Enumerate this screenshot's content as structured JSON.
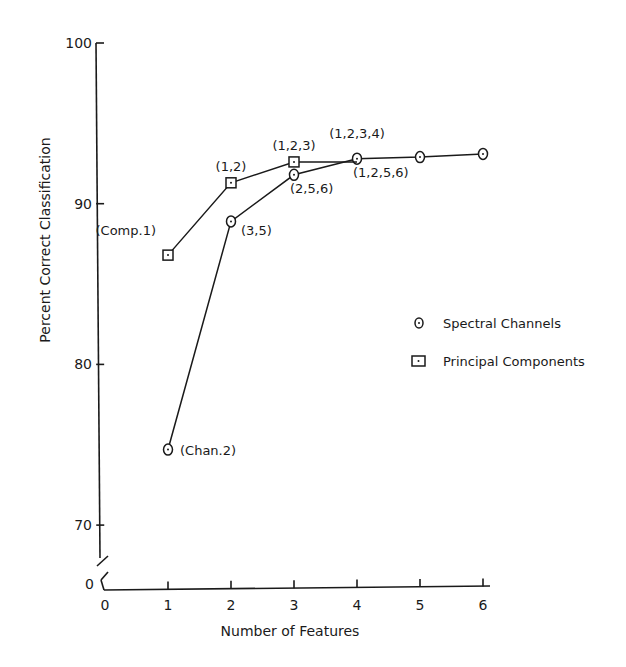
{
  "chart_data": {
    "type": "line",
    "title": "",
    "xlabel": "Number of Features",
    "ylabel": "Percent Correct Classification",
    "xlim": [
      0,
      6
    ],
    "ylim": [
      0,
      100
    ],
    "y_axis_break": true,
    "x_ticks": [
      "0",
      "1",
      "2",
      "3",
      "4",
      "5",
      "6"
    ],
    "y_ticks": [
      "0",
      "70",
      "80",
      "90",
      "100"
    ],
    "grid": false,
    "legend_position": "right",
    "series": [
      {
        "name": "Spectral Channels",
        "marker": "circle",
        "x": [
          1,
          2,
          3,
          4,
          5,
          6
        ],
        "values": [
          74.7,
          88.9,
          91.8,
          92.8,
          92.9,
          93.1
        ],
        "point_labels": [
          "(Chan.2)",
          "(3,5)",
          "(2,5,6)",
          "(1,2,5,6)",
          "",
          ""
        ]
      },
      {
        "name": "Principal Components",
        "marker": "square",
        "x": [
          1,
          2,
          3,
          4
        ],
        "values": [
          86.8,
          91.3,
          92.6,
          92.6
        ],
        "point_labels": [
          "(Comp.1)",
          "(1,2)",
          "(1,2,3)",
          "(1,2,3,4)"
        ]
      }
    ]
  }
}
